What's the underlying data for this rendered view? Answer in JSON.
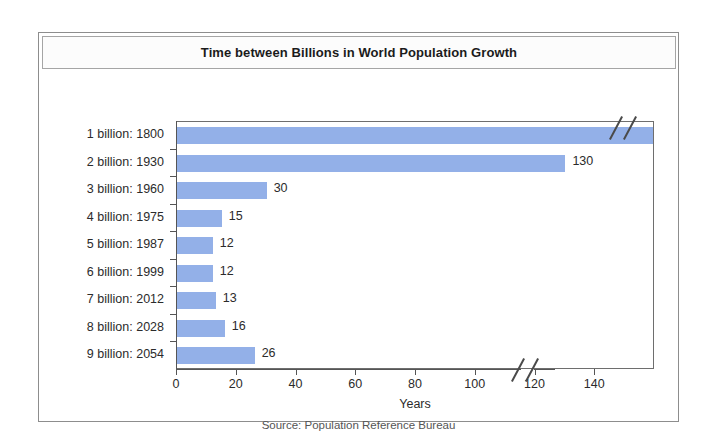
{
  "chart_data": {
    "type": "bar",
    "orientation": "horizontal",
    "title": "Time between Billions in World Population Growth",
    "xlabel": "Years",
    "ylabel": "",
    "source": "Source: Population Reference Bureau",
    "categories": [
      "1 billion: 1800",
      "2 billion: 1930",
      "3 billion: 1960",
      "4 billion: 1975",
      "5 billion: 1987",
      "6 billion: 1999",
      "7 billion: 2012",
      "8 billion: 2028",
      "9 billion: 2054"
    ],
    "values": [
      null,
      130,
      30,
      15,
      12,
      12,
      13,
      16,
      26
    ],
    "value_labels": [
      "",
      "130",
      "30",
      "15",
      "12",
      "12",
      "13",
      "16",
      "26"
    ],
    "xlim": [
      0,
      160
    ],
    "xticks": [
      0,
      20,
      40,
      60,
      80,
      100,
      120,
      140
    ],
    "xticklabels": [
      "0",
      "20",
      "40",
      "60",
      "80",
      "100",
      "120",
      "140"
    ],
    "grid": false,
    "legend": false,
    "axis_break": {
      "present": true,
      "note": "first bar (1 billion: 1800) extends past axis break; bar runs off scale"
    },
    "bar_color": "#93b0e8",
    "text_color": "#2b2b2b",
    "axis_color": "#555555",
    "frame_color": "#8d8d8d"
  }
}
